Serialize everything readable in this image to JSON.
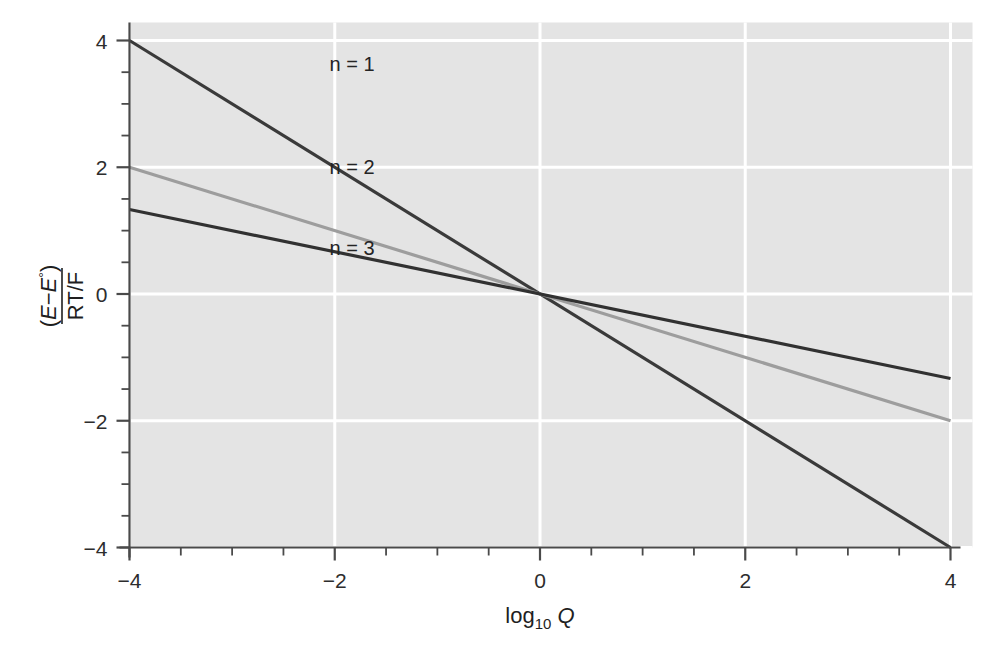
{
  "figure": {
    "background_color": "#ffffff",
    "plot_background_color": "#e4e4e4",
    "gridline_color": "#ffffff",
    "axis_color": "#4a4a4a"
  },
  "chart_data": {
    "type": "line",
    "title": "",
    "xlabel": "log10 Q",
    "xlabel_parts": {
      "base": "log",
      "subscript": "10",
      "variable": "Q"
    },
    "ylabel": "(E - E°) / (RT/F)",
    "ylabel_parts": {
      "numerator_open": "(",
      "numerator_e1": "E",
      "numerator_minus": "−",
      "numerator_e2": "E",
      "numerator_degree": "°",
      "numerator_close": ")",
      "denominator": "RT/F"
    },
    "xlim": [
      -4,
      4
    ],
    "ylim": [
      -4,
      4
    ],
    "xticks": [
      -4,
      -2,
      0,
      2,
      4
    ],
    "yticks": [
      -4,
      -2,
      0,
      2,
      4
    ],
    "xtick_labels": [
      "−4",
      "−2",
      "0",
      "2",
      "4"
    ],
    "ytick_labels": [
      "−4",
      "−2",
      "0",
      "2",
      "4"
    ],
    "minor_tick_step": 0.5,
    "grid": true,
    "grid_axes": "both",
    "legend_position": "inline-annotations",
    "series": [
      {
        "name": "n = 1",
        "label": "n = 1",
        "slope": -1.0,
        "intercept": 0,
        "color": "#3a3a3a",
        "width": 3.2,
        "x": [
          -4,
          4
        ],
        "values": [
          4,
          -4
        ],
        "label_x": -2.05,
        "label_y": 3.52
      },
      {
        "name": "n = 2",
        "label": "n = 2",
        "slope": -0.5,
        "intercept": 0,
        "color": "#9d9d9d",
        "width": 3.2,
        "x": [
          -4,
          4
        ],
        "values": [
          2,
          -2
        ],
        "label_x": -2.05,
        "label_y": 1.9
      },
      {
        "name": "n = 3",
        "label": "n = 3",
        "slope": -0.3333,
        "intercept": 0,
        "color": "#313131",
        "width": 3.2,
        "x": [
          -4,
          4
        ],
        "values": [
          1.3333,
          -1.3333
        ],
        "label_x": -2.05,
        "label_y": 0.62
      }
    ]
  }
}
